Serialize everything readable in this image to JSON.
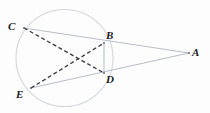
{
  "figure": {
    "background_color": "#fdfdfd",
    "stroke_colors": {
      "circle": "#d3d6da",
      "solid_line": "#b9bfc6",
      "dashed_line": "#3a3a42",
      "label_text": "#1b1b1f"
    },
    "circle": {
      "cx": 64.5,
      "cy": 58.0,
      "r": 48.5,
      "stroke_width": 1.1
    },
    "points": [
      {
        "id": "C",
        "label": "C",
        "x": 24.0,
        "y": 28.0,
        "label_x": 8,
        "label_y": 21,
        "on_circle": true
      },
      {
        "id": "B",
        "label": "B",
        "x": 104.0,
        "y": 43.0,
        "label_x": 106,
        "label_y": 30,
        "on_circle": true
      },
      {
        "id": "A",
        "label": "A",
        "x": 189.0,
        "y": 53.0,
        "label_x": 192,
        "label_y": 47,
        "on_circle": false
      },
      {
        "id": "D",
        "label": "D",
        "x": 104.0,
        "y": 73.0,
        "label_x": 106,
        "label_y": 74,
        "on_circle": true
      },
      {
        "id": "E",
        "label": "E",
        "x": 31.0,
        "y": 88.0,
        "label_x": 16,
        "label_y": 89,
        "on_circle": true
      }
    ],
    "segments": [
      {
        "id": "CBA",
        "name": "secant-c-b-a",
        "from": "C",
        "to": "A",
        "style": "solid",
        "stroke": "#b9bfc6",
        "width": 1.1
      },
      {
        "id": "EDA",
        "name": "secant-e-d-a",
        "from": "E",
        "to": "A",
        "style": "solid",
        "stroke": "#b9bfc6",
        "width": 1.1
      },
      {
        "id": "BD",
        "name": "chord-b-d",
        "from": "B",
        "to": "D",
        "style": "solid",
        "stroke": "#b9bfc6",
        "width": 1.1
      },
      {
        "id": "CD",
        "name": "chord-c-d",
        "from": "C",
        "to": "D",
        "style": "dashed",
        "stroke": "#3a3a42",
        "width": 1.3,
        "dash": "4 2.6"
      },
      {
        "id": "EB",
        "name": "chord-e-b",
        "from": "E",
        "to": "B",
        "style": "dashed",
        "stroke": "#3a3a42",
        "width": 1.3,
        "dash": "4 2.6"
      }
    ],
    "labels": {
      "C": "C",
      "B": "B",
      "A": "A",
      "D": "D",
      "E": "E"
    }
  }
}
